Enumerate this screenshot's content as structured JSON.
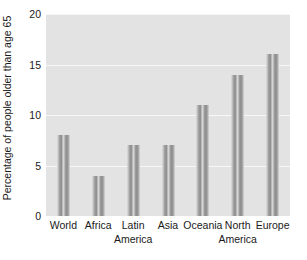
{
  "chart_data": {
    "type": "bar",
    "title": "",
    "subtitle": "",
    "xlabel": "",
    "ylabel": "Percentage of people older than age 65",
    "categories": [
      "World",
      "Africa",
      "Latin America",
      "Asia",
      "Oceania",
      "North America",
      "Europe"
    ],
    "category_lines": [
      [
        "World"
      ],
      [
        "Africa"
      ],
      [
        "Latin",
        "America"
      ],
      [
        "Asia"
      ],
      [
        "Oceania"
      ],
      [
        "North",
        "America"
      ],
      [
        "Europe"
      ]
    ],
    "values": [
      8,
      4,
      7,
      7,
      11,
      14,
      16
    ],
    "ylim": [
      0,
      20
    ],
    "yticks": [
      0,
      5,
      10,
      15,
      20
    ],
    "ytick_labels": [
      "0",
      "5",
      "10",
      "15",
      "20"
    ],
    "grid": true,
    "grid_axis": "y",
    "legend": false,
    "legend_position": "none",
    "colors": {
      "plot_background": "#e3e3e3",
      "figure_background": "#ffffff",
      "gridline": "#f7f7f7",
      "bar_fill": "#9a9a9a",
      "bar_edge": "#8c8c8c",
      "text": "#1a1a1a"
    }
  }
}
